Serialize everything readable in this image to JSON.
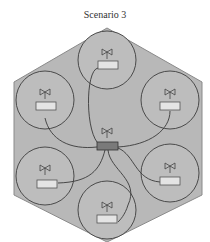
{
  "title": "Scenario 3",
  "colors": {
    "hexagon_fill": "#b8b8b8",
    "hexagon_stroke": "#8a8a8a",
    "cell_fill": "#bdbdbd",
    "cell_stroke": "#4a4a4a",
    "node_box_fill": "#e4e4e4",
    "hub_box_fill": "#7a7a7a",
    "link_stroke": "#3a3a3a"
  },
  "diagram": {
    "region": "hexagon",
    "hub": {
      "label": "central node",
      "antenna": true
    },
    "cells": [
      {
        "id": "top",
        "antenna": true
      },
      {
        "id": "upper-left",
        "antenna": true
      },
      {
        "id": "upper-right",
        "antenna": true
      },
      {
        "id": "lower-left",
        "antenna": true
      },
      {
        "id": "lower-right",
        "antenna": true
      },
      {
        "id": "bottom",
        "antenna": true
      }
    ],
    "links": [
      "hub-top",
      "hub-upper-left",
      "hub-upper-right",
      "hub-lower-left",
      "hub-lower-right",
      "hub-bottom"
    ]
  }
}
